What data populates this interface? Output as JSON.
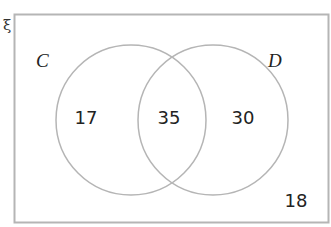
{
  "diagram": {
    "type": "venn",
    "universal_set_symbol": "ξ",
    "sets": [
      {
        "label": "C",
        "only_count": "17"
      },
      {
        "label": "D",
        "only_count": "30"
      }
    ],
    "intersection_count": "35",
    "outside_count": "18",
    "colors": {
      "outline": "#b5b5b5",
      "text": "#222222",
      "background": "#ffffff"
    }
  }
}
